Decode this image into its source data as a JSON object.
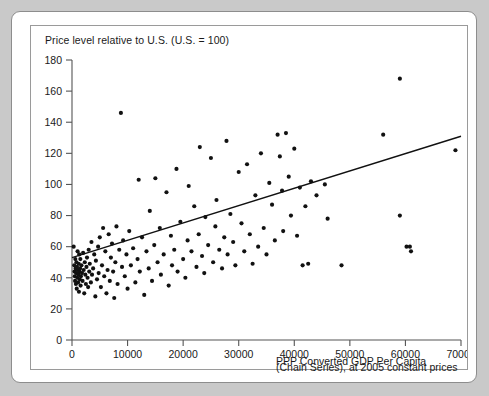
{
  "figure": {
    "background_color": "#c9c9c9",
    "panel_color": "#ffffff",
    "border_color": "#8d8d8d"
  },
  "chart_data": {
    "type": "scatter",
    "title": "Price level relative to U.S. (U.S. = 100)",
    "subtitle": "",
    "xlabel": "PPP Converted GDP Per Capita",
    "xlabel_line2": "(Chain Series), at 2005 constant prices",
    "ylabel": "",
    "xlim": [
      0,
      70000
    ],
    "ylim": [
      0,
      180
    ],
    "xticks": [
      0,
      10000,
      20000,
      30000,
      40000,
      50000,
      60000,
      70000
    ],
    "xtick_labels": [
      "0",
      "10000",
      "20000",
      "30000",
      "40000",
      "50000",
      "60000",
      "70000"
    ],
    "yticks": [
      0,
      20,
      40,
      60,
      80,
      100,
      120,
      140,
      160,
      180
    ],
    "ytick_labels": [
      "0",
      "20",
      "40",
      "60",
      "80",
      "100",
      "120",
      "140",
      "160",
      "180"
    ],
    "grid": false,
    "legend": null,
    "legend_position": "none",
    "marker_color": "#111111",
    "marker_size": 3.0,
    "trend_line": {
      "label": "linear fit",
      "color": "#111111",
      "x": [
        0,
        70000
      ],
      "y": [
        53,
        131
      ]
    },
    "series": [
      {
        "name": "Countries",
        "points": [
          [
            300,
            60
          ],
          [
            400,
            48
          ],
          [
            450,
            44
          ],
          [
            500,
            41
          ],
          [
            550,
            38
          ],
          [
            600,
            52
          ],
          [
            650,
            46
          ],
          [
            700,
            36
          ],
          [
            750,
            43
          ],
          [
            800,
            50
          ],
          [
            850,
            33
          ],
          [
            900,
            47
          ],
          [
            950,
            40
          ],
          [
            1000,
            57
          ],
          [
            1050,
            45
          ],
          [
            1100,
            37
          ],
          [
            1150,
            42
          ],
          [
            1200,
            49
          ],
          [
            1250,
            31
          ],
          [
            1300,
            55
          ],
          [
            1350,
            44
          ],
          [
            1400,
            39
          ],
          [
            1450,
            46
          ],
          [
            1500,
            52
          ],
          [
            1550,
            35
          ],
          [
            1600,
            41
          ],
          [
            1700,
            48
          ],
          [
            1800,
            43
          ],
          [
            1900,
            38
          ],
          [
            2000,
            56
          ],
          [
            2100,
            45
          ],
          [
            2200,
            30
          ],
          [
            2300,
            50
          ],
          [
            2400,
            42
          ],
          [
            2500,
            36
          ],
          [
            2600,
            47
          ],
          [
            2700,
            53
          ],
          [
            2800,
            40
          ],
          [
            2900,
            34
          ],
          [
            3000,
            58
          ],
          [
            3100,
            44
          ],
          [
            3200,
            49
          ],
          [
            3400,
            37
          ],
          [
            3500,
            63
          ],
          [
            3600,
            42
          ],
          [
            3800,
            46
          ],
          [
            4000,
            55
          ],
          [
            4200,
            28
          ],
          [
            4300,
            51
          ],
          [
            4500,
            39
          ],
          [
            4700,
            60
          ],
          [
            4800,
            43
          ],
          [
            5000,
            66
          ],
          [
            5200,
            34
          ],
          [
            5400,
            48
          ],
          [
            5600,
            72
          ],
          [
            5800,
            41
          ],
          [
            6000,
            57
          ],
          [
            6200,
            30
          ],
          [
            6400,
            45
          ],
          [
            6600,
            68
          ],
          [
            6800,
            38
          ],
          [
            7000,
            53
          ],
          [
            7200,
            62
          ],
          [
            7400,
            44
          ],
          [
            7600,
            27
          ],
          [
            7800,
            50
          ],
          [
            8000,
            73
          ],
          [
            8200,
            36
          ],
          [
            8500,
            58
          ],
          [
            8800,
            146
          ],
          [
            9000,
            47
          ],
          [
            9200,
            64
          ],
          [
            9500,
            41
          ],
          [
            9800,
            55
          ],
          [
            10000,
            33
          ],
          [
            10300,
            70
          ],
          [
            10600,
            48
          ],
          [
            11000,
            59
          ],
          [
            11400,
            37
          ],
          [
            11800,
            52
          ],
          [
            12000,
            103
          ],
          [
            12200,
            44
          ],
          [
            12600,
            66
          ],
          [
            13000,
            29
          ],
          [
            13400,
            57
          ],
          [
            13800,
            46
          ],
          [
            14000,
            83
          ],
          [
            14400,
            38
          ],
          [
            14800,
            61
          ],
          [
            15000,
            104
          ],
          [
            15400,
            50
          ],
          [
            15800,
            72
          ],
          [
            16000,
            42
          ],
          [
            16500,
            55
          ],
          [
            17000,
            95
          ],
          [
            17400,
            35
          ],
          [
            17800,
            67
          ],
          [
            18000,
            48
          ],
          [
            18400,
            58
          ],
          [
            18800,
            110
          ],
          [
            19000,
            44
          ],
          [
            19500,
            76
          ],
          [
            20000,
            52
          ],
          [
            20400,
            40
          ],
          [
            20800,
            64
          ],
          [
            21000,
            99
          ],
          [
            21500,
            57
          ],
          [
            22000,
            86
          ],
          [
            22400,
            47
          ],
          [
            22800,
            68
          ],
          [
            23000,
            124
          ],
          [
            23400,
            54
          ],
          [
            23800,
            43
          ],
          [
            24000,
            79
          ],
          [
            24500,
            61
          ],
          [
            25000,
            117
          ],
          [
            25400,
            50
          ],
          [
            25800,
            73
          ],
          [
            26000,
            90
          ],
          [
            26500,
            58
          ],
          [
            27000,
            46
          ],
          [
            27400,
            66
          ],
          [
            27800,
            128
          ],
          [
            28000,
            55
          ],
          [
            28500,
            81
          ],
          [
            29000,
            63
          ],
          [
            29400,
            48
          ],
          [
            30000,
            108
          ],
          [
            30500,
            75
          ],
          [
            31000,
            57
          ],
          [
            31500,
            113
          ],
          [
            32000,
            68
          ],
          [
            32500,
            49
          ],
          [
            33000,
            93
          ],
          [
            33500,
            60
          ],
          [
            34000,
            120
          ],
          [
            34500,
            72
          ],
          [
            35000,
            55
          ],
          [
            35500,
            101
          ],
          [
            36000,
            87
          ],
          [
            36500,
            64
          ],
          [
            37000,
            132
          ],
          [
            37400,
            118
          ],
          [
            37800,
            96
          ],
          [
            38000,
            70
          ],
          [
            38500,
            133
          ],
          [
            39000,
            105
          ],
          [
            39400,
            80
          ],
          [
            40000,
            123
          ],
          [
            40500,
            67
          ],
          [
            41000,
            98
          ],
          [
            41500,
            48
          ],
          [
            42000,
            86
          ],
          [
            42500,
            49
          ],
          [
            43000,
            102
          ],
          [
            44000,
            93
          ],
          [
            45500,
            100
          ],
          [
            46000,
            78
          ],
          [
            48500,
            48
          ],
          [
            59000,
            168
          ],
          [
            56000,
            132
          ],
          [
            59000,
            80
          ],
          [
            60200,
            60
          ],
          [
            60800,
            60
          ],
          [
            61000,
            57
          ],
          [
            69000,
            122
          ]
        ]
      }
    ]
  }
}
